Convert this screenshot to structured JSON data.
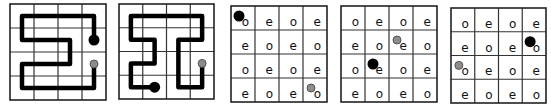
{
  "figure": {
    "grid_size": 4,
    "colors": {
      "start_dot": "#000000",
      "end_dot": "#8c8c8c",
      "end_dot_stroke": "#555555",
      "path": "#000000",
      "grid": "#333333"
    },
    "panels": [
      {
        "id": "path-a",
        "type": "path",
        "x": 10,
        "y": 4,
        "size": 96,
        "path_cells": [
          [
            3,
            1
          ],
          [
            3,
            0
          ],
          [
            0,
            0
          ],
          [
            0,
            1
          ],
          [
            2,
            1
          ],
          [
            2,
            2
          ],
          [
            0,
            2
          ],
          [
            0,
            3
          ],
          [
            3,
            3
          ],
          [
            3,
            2
          ]
        ],
        "start": [
          3,
          1
        ],
        "end": [
          3,
          2
        ]
      },
      {
        "id": "path-b",
        "type": "path",
        "x": 119,
        "y": 4,
        "size": 95,
        "path_cells": [
          [
            1,
            3
          ],
          [
            0,
            3
          ],
          [
            0,
            2
          ],
          [
            1,
            2
          ],
          [
            1,
            1
          ],
          [
            0,
            1
          ],
          [
            0,
            0
          ],
          [
            3,
            0
          ],
          [
            3,
            1
          ],
          [
            2,
            1
          ],
          [
            2,
            3
          ],
          [
            3,
            3
          ],
          [
            3,
            2
          ]
        ],
        "start": [
          1,
          3
        ],
        "end": [
          3,
          2
        ]
      },
      {
        "id": "parity-a",
        "type": "parity",
        "x": 231,
        "y": 6,
        "size": 96,
        "labels": [
          [
            "o",
            "e",
            "o",
            "e"
          ],
          [
            "e",
            "o",
            "e",
            "o"
          ],
          [
            "o",
            "e",
            "o",
            "e"
          ],
          [
            "e",
            "o",
            "e",
            "o"
          ]
        ],
        "black_dot": [
          0,
          0
        ],
        "gray_dot": [
          3,
          3
        ]
      },
      {
        "id": "parity-b",
        "type": "parity",
        "x": 341,
        "y": 6,
        "size": 96,
        "labels": [
          [
            "o",
            "e",
            "o",
            "e"
          ],
          [
            "e",
            "o",
            "e",
            "o"
          ],
          [
            "o",
            "e",
            "o",
            "e"
          ],
          [
            "e",
            "o",
            "e",
            "o"
          ]
        ],
        "black_dot": [
          1,
          2
        ],
        "gray_dot": [
          2,
          1
        ]
      },
      {
        "id": "parity-c",
        "type": "parity",
        "x": 451,
        "y": 8,
        "size": 95,
        "labels": [
          [
            "o",
            "e",
            "o",
            "e"
          ],
          [
            "e",
            "o",
            "e",
            "o"
          ],
          [
            "o",
            "e",
            "o",
            "e"
          ],
          [
            "e",
            "o",
            "e",
            "o"
          ]
        ],
        "black_dot": [
          3,
          1
        ],
        "gray_dot": [
          0,
          2
        ]
      }
    ]
  }
}
